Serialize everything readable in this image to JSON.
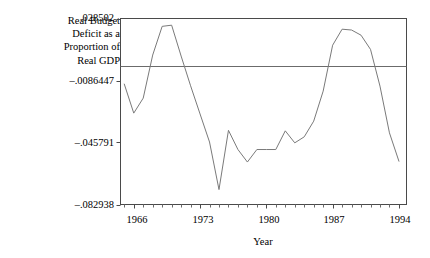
{
  "chart_data": {
    "type": "line",
    "title": "",
    "subtitle": "",
    "ylabel": "Real Budget Deficit as a Proportion of Real GDP",
    "ylabel_lines": [
      "Real Budget",
      "Deficit as a",
      "Proportion of",
      "Real GDP"
    ],
    "xlabel": "Year",
    "xlim": [
      1964.6,
      1994.8
    ],
    "ylim": [
      -0.082938,
      0.028502
    ],
    "grid": false,
    "legend": null,
    "yticks": [
      0.028502,
      -0.0086447,
      -0.045791,
      -0.082938
    ],
    "ytick_labels": [
      ".028502",
      "–.0086447",
      "–.045791",
      "–.082938"
    ],
    "xticks": [
      1966,
      1973,
      1980,
      1987,
      1994
    ],
    "xtick_labels": [
      "1966",
      "1973",
      "1980",
      "1987",
      "1994"
    ],
    "xminor_step": 1,
    "annotations": [
      {
        "type": "hline",
        "y": 0.0,
        "label": "zero reference line"
      }
    ],
    "x": [
      1965,
      1966,
      1967,
      1968,
      1969,
      1970,
      1971,
      1972,
      1973,
      1974,
      1975,
      1976,
      1977,
      1978,
      1979,
      1980,
      1981,
      1982,
      1983,
      1984,
      1985,
      1986,
      1987,
      1988,
      1989,
      1990,
      1991,
      1992,
      1993,
      1994
    ],
    "values": [
      -0.0108,
      -0.0282,
      -0.0192,
      0.0066,
      0.0238,
      0.0245,
      0.006,
      -0.0118,
      -0.0287,
      -0.0455,
      -0.074,
      -0.0385,
      -0.05,
      -0.0575,
      -0.05,
      -0.05,
      -0.05,
      -0.0388,
      -0.046,
      -0.0424,
      -0.033,
      -0.015,
      0.0125,
      0.0221,
      0.0216,
      0.0185,
      0.01,
      -0.012,
      -0.04,
      -0.057
    ]
  },
  "axis": {
    "ytick_0": ".028502",
    "ytick_1": "–.0086447",
    "ytick_2": "–.045791",
    "ytick_3": "–.082938",
    "xtick_0": "1966",
    "xtick_1": "1973",
    "xtick_2": "1980",
    "xtick_3": "1987",
    "xtick_4": "1994",
    "xtitle": "Year"
  },
  "ylabel": {
    "line0": "Real Budget",
    "line1": "Deficit as a",
    "line2": "Proportion of",
    "line3": "Real GDP"
  },
  "colors": {
    "line": "#7a7a7a",
    "frame": "#4a4a4a",
    "zero": "#6b6b6b",
    "background": "#ffffff",
    "text": "#000000"
  }
}
